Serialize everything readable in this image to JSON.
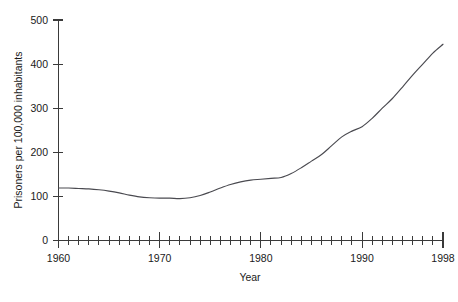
{
  "chart_data": {
    "type": "line",
    "title": "",
    "xlabel": "Year",
    "ylabel": "Prisoners per 100,000 inhabitants",
    "xlim": [
      1960,
      1998
    ],
    "ylim": [
      0,
      500
    ],
    "grid": false,
    "legend": null,
    "y_ticks": [
      0,
      100,
      200,
      300,
      400,
      500
    ],
    "y_tick_labels": [
      "0",
      "100",
      "200",
      "300",
      "400",
      "500"
    ],
    "x_ticks": [
      1960,
      1970,
      1980,
      1990,
      1998
    ],
    "x_tick_labels": [
      "1960",
      "1970",
      "1980",
      "1990",
      "1998"
    ],
    "x_minor_tick_interval": 1,
    "line_color": "#4a4a50",
    "x": [
      1960,
      1961,
      1962,
      1963,
      1964,
      1965,
      1966,
      1967,
      1968,
      1969,
      1970,
      1971,
      1972,
      1973,
      1974,
      1975,
      1976,
      1977,
      1978,
      1979,
      1980,
      1981,
      1982,
      1983,
      1984,
      1985,
      1986,
      1987,
      1988,
      1989,
      1990,
      1991,
      1992,
      1993,
      1994,
      1995,
      1996,
      1997,
      1998
    ],
    "values": [
      119,
      119,
      118,
      117,
      115,
      112,
      108,
      103,
      99,
      97,
      96,
      96,
      95,
      97,
      102,
      110,
      119,
      127,
      133,
      137,
      139,
      141,
      143,
      152,
      165,
      180,
      195,
      215,
      235,
      248,
      258,
      277,
      300,
      322,
      348,
      375,
      400,
      425,
      445
    ],
    "series": [
      {
        "name": "Prisoners per 100,000 inhabitants",
        "values": [
          119,
          119,
          118,
          117,
          115,
          112,
          108,
          103,
          99,
          97,
          96,
          96,
          95,
          97,
          102,
          110,
          119,
          127,
          133,
          137,
          139,
          141,
          143,
          152,
          165,
          180,
          195,
          215,
          235,
          248,
          258,
          277,
          300,
          322,
          348,
          375,
          400,
          425,
          445
        ]
      }
    ]
  }
}
